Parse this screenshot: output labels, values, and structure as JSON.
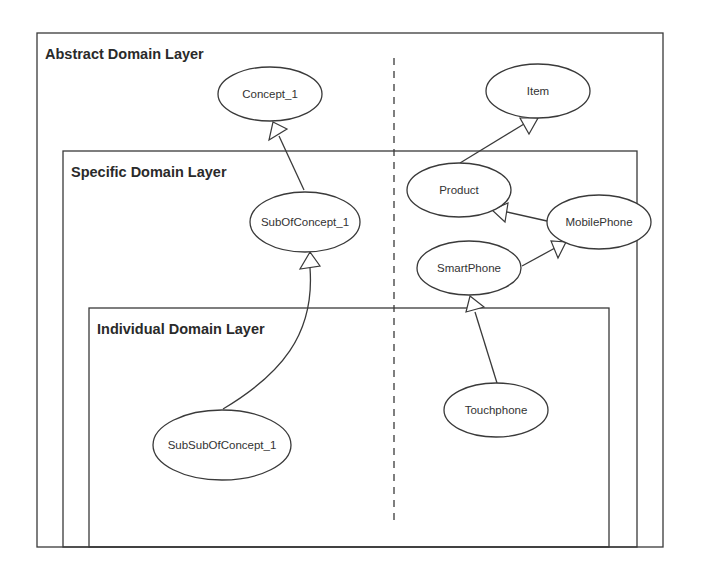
{
  "layers": [
    {
      "id": "abstract",
      "title": "Abstract Domain Layer"
    },
    {
      "id": "specific",
      "title": "Specific Domain Layer"
    },
    {
      "id": "individual",
      "title": "Individual Domain Layer"
    }
  ],
  "nodes": [
    {
      "id": "concept_1",
      "label": "Concept_1",
      "layer": "abstract"
    },
    {
      "id": "item",
      "label": "Item",
      "layer": "abstract"
    },
    {
      "id": "sub_of_concept_1",
      "label": "SubOfConcept_1",
      "layer": "specific"
    },
    {
      "id": "product",
      "label": "Product",
      "layer": "specific"
    },
    {
      "id": "mobile_phone",
      "label": "MobilePhone",
      "layer": "specific"
    },
    {
      "id": "smart_phone",
      "label": "SmartPhone",
      "layer": "specific"
    },
    {
      "id": "sub_sub_of_concept_1",
      "label": "SubSubOfConcept_1",
      "layer": "individual"
    },
    {
      "id": "touchphone",
      "label": "Touchphone",
      "layer": "individual"
    }
  ],
  "edges": [
    {
      "from": "sub_of_concept_1",
      "to": "concept_1",
      "type": "generalization"
    },
    {
      "from": "sub_sub_of_concept_1",
      "to": "sub_of_concept_1",
      "type": "generalization"
    },
    {
      "from": "product",
      "to": "item",
      "type": "generalization"
    },
    {
      "from": "mobile_phone",
      "to": "product",
      "type": "generalization"
    },
    {
      "from": "smart_phone",
      "to": "mobile_phone",
      "type": "generalization"
    },
    {
      "from": "touchphone",
      "to": "smart_phone",
      "type": "generalization"
    }
  ]
}
